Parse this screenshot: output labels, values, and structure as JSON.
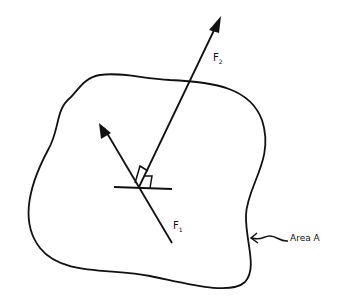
{
  "diagram": {
    "labels": {
      "f2": "F",
      "f2_sub": "2",
      "f1": "F",
      "f1_sub": "1",
      "area": "Area A"
    },
    "colors": {
      "stroke": "#111111",
      "background": "#ffffff"
    }
  }
}
